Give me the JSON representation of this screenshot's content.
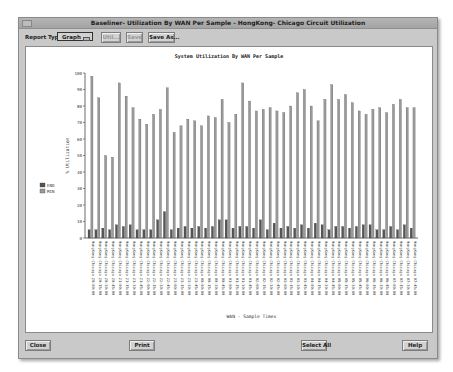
{
  "window": {
    "title": "Baseliner- Utilization By WAN Per Sample - HongKong- Chicago Circuit Utilization"
  },
  "toolbar": {
    "report_type_label": "Report Type",
    "report_type_value": "Graph",
    "util_label": "Util...",
    "save_label": "Save",
    "save_as_label": "Save As..."
  },
  "footer": {
    "close_label": "Close",
    "print_label": "Print",
    "select_all_label": "Select All",
    "help_label": "Help"
  },
  "chart_data": {
    "type": "bar",
    "title": "System Utilization By WAN Per Sample",
    "xlabel": "WAN - Sample Times",
    "ylabel": "% Utilization",
    "ylim": [
      0,
      100
    ],
    "yticks": [
      0,
      10,
      20,
      30,
      40,
      50,
      60,
      70,
      80,
      90,
      100
    ],
    "grid": false,
    "legend_position": "left",
    "categories": [
      "HongKong-Chicago 20:00:00",
      "HongKong-Chicago 20:15:00",
      "HongKong-Chicago 20:30:00",
      "HongKong-Chicago 20:45:00",
      "HongKong-Chicago 21:00:00",
      "HongKong-Chicago 21:15:00",
      "HongKong-Chicago 21:30:00",
      "HongKong-Chicago 21:45:00",
      "HongKong-Chicago 22:00:00",
      "HongKong-Chicago 22:15:00",
      "HongKong-Chicago 22:30:00",
      "HongKong-Chicago 22:45:00",
      "HongKong-Chicago 23:00:00",
      "HongKong-Chicago 23:15:00",
      "HongKong-Chicago 23:30:00",
      "HongKong-Chicago 23:45:00",
      "HongKong-Chicago 00:00:00",
      "HongKong-Chicago 00:15:00",
      "HongKong-Chicago 00:30:00",
      "HongKong-Chicago 00:45:00",
      "HongKong-Chicago 01:00:00",
      "HongKong-Chicago 01:15:00",
      "HongKong-Chicago 01:30:00",
      "HongKong-Chicago 01:45:00",
      "HongKong-Chicago 02:00:00",
      "HongKong-Chicago 02:15:00",
      "HongKong-Chicago 02:30:00",
      "HongKong-Chicago 02:45:00",
      "HongKong-Chicago 03:00:00",
      "HongKong-Chicago 03:15:00",
      "HongKong-Chicago 03:30:00",
      "HongKong-Chicago 03:45:00",
      "HongKong-Chicago 04:00:00",
      "HongKong-Chicago 04:15:00",
      "HongKong-Chicago 04:30:00",
      "HongKong-Chicago 04:45:00",
      "HongKong-Chicago 05:00:00",
      "HongKong-Chicago 05:15:00",
      "HongKong-Chicago 05:30:00",
      "HongKong-Chicago 05:45:00",
      "HongKong-Chicago 06:00:00",
      "HongKong-Chicago 06:15:00",
      "HongKong-Chicago 06:30:00",
      "HongKong-Chicago 06:45:00",
      "HongKong-Chicago 07:00:00",
      "HongKong-Chicago 07:15:00",
      "HongKong-Chicago 07:30:00",
      "HongKong-Chicago 07:45:00"
    ],
    "series": [
      {
        "name": "END",
        "color": "#555555",
        "values": [
          5,
          5,
          6,
          5,
          8,
          7,
          8,
          5,
          5,
          5,
          11,
          16,
          5,
          6,
          7,
          6,
          7,
          6,
          7,
          11,
          11,
          6,
          7,
          7,
          6,
          11,
          5,
          9,
          6,
          7,
          6,
          8,
          6,
          9,
          8,
          5,
          7,
          7,
          6,
          7,
          8,
          8,
          5,
          5,
          7,
          5,
          8,
          6
        ]
      },
      {
        "name": "MIN",
        "color": "#9a9a9a",
        "values": [
          98,
          85,
          50,
          49,
          94,
          86,
          79,
          72,
          69,
          75,
          78,
          91,
          64,
          68,
          72,
          71,
          68,
          74,
          73,
          84,
          70,
          75,
          94,
          83,
          77,
          78,
          79,
          77,
          76,
          80,
          88,
          90,
          80,
          71,
          84,
          93,
          84,
          87,
          82,
          77,
          75,
          78,
          79,
          76,
          81,
          84,
          79,
          79
        ]
      }
    ]
  }
}
